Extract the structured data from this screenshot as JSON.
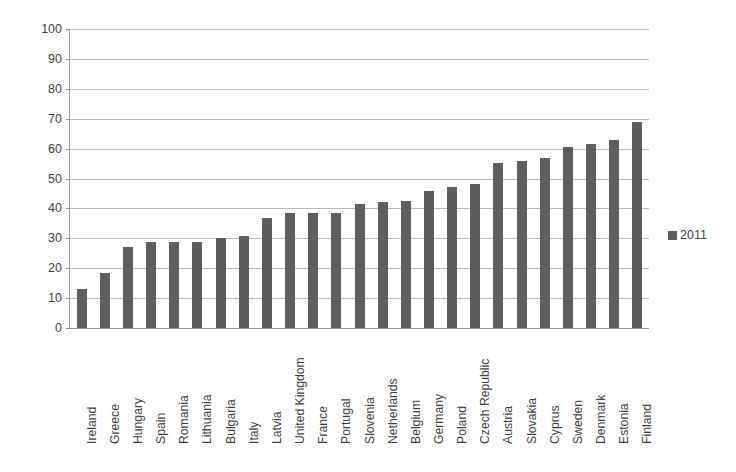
{
  "chart_data": {
    "type": "bar",
    "title": "",
    "subtitle": "",
    "xlabel": "",
    "ylabel": "percent answering \"Yes\"",
    "ylim": [
      0,
      100
    ],
    "ytick_step": 10,
    "yticks": [
      100,
      90,
      80,
      70,
      60,
      50,
      40,
      30,
      20,
      10,
      0
    ],
    "grid": true,
    "legend_position": "right",
    "bar_color": "#5e5e5e",
    "categories": [
      "Ireland",
      "Greece",
      "Hungary",
      "Spain",
      "Romania",
      "Lithuania",
      "Bulgaria",
      "Italy",
      "Latvia",
      "United Kingdom",
      "France",
      "Portugal",
      "Slovenia",
      "Netherlands",
      "Belgium",
      "Germany",
      "Poland",
      "Czech Republic",
      "Austria",
      "Slovakia",
      "Cyprus",
      "Sweden",
      "Denmark",
      "Estonia",
      "Finland"
    ],
    "series": [
      {
        "name": "2011",
        "values": [
          13,
          18.5,
          27,
          28.8,
          28.8,
          28.8,
          30,
          30.7,
          36.7,
          38.5,
          38.5,
          38.3,
          41.5,
          42.3,
          42.5,
          45.8,
          47,
          48.2,
          55.3,
          56,
          57,
          60.5,
          61.5,
          63,
          69
        ]
      }
    ]
  },
  "legend": {
    "entries": [
      {
        "label": "2011",
        "color": "#5e5e5e"
      }
    ]
  }
}
